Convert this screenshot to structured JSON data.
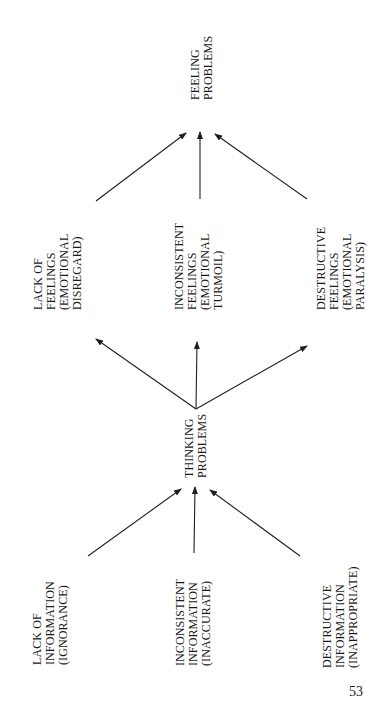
{
  "page_number": "53",
  "nodes": {
    "feeling_problems": {
      "lines": [
        "FEELING",
        "PROBLEMS"
      ]
    },
    "lack_of_feelings": {
      "lines": [
        "LACK OF",
        "FEELINGS",
        "(EMOTIONAL",
        "DISREGARD)"
      ]
    },
    "inconsistent_feelings": {
      "lines": [
        "INCONSISTENT",
        "FEELINGS",
        "(EMOTIONAL",
        "TURMOIL)"
      ]
    },
    "destructive_feelings": {
      "lines": [
        "DESTRUCTIVE",
        "FEELINGS",
        "(EMOTIONAL",
        "PARALYSIS)"
      ]
    },
    "thinking_problems": {
      "lines": [
        "THINKING",
        "PROBLEMS"
      ]
    },
    "lack_of_information": {
      "lines": [
        "LACK OF",
        "INFORMATION",
        "(IGNORANCE)"
      ]
    },
    "inconsistent_information": {
      "lines": [
        "INCONSISTENT",
        "INFORMATION",
        "(INACCURATE)"
      ]
    },
    "destructive_information": {
      "lines": [
        "DESTRUCTIVE",
        "INFORMATION",
        "(INAPPROPRIATE)"
      ]
    }
  },
  "edges": [
    {
      "from": "lack_of_information",
      "to": "thinking_problems"
    },
    {
      "from": "inconsistent_information",
      "to": "thinking_problems"
    },
    {
      "from": "destructive_information",
      "to": "thinking_problems"
    },
    {
      "from": "thinking_problems",
      "to": "lack_of_feelings"
    },
    {
      "from": "thinking_problems",
      "to": "inconsistent_feelings"
    },
    {
      "from": "thinking_problems",
      "to": "destructive_feelings"
    },
    {
      "from": "lack_of_feelings",
      "to": "feeling_problems"
    },
    {
      "from": "inconsistent_feelings",
      "to": "feeling_problems"
    },
    {
      "from": "destructive_feelings",
      "to": "feeling_problems"
    }
  ],
  "colors": {
    "ink": "#1a1a1a",
    "background": "#ffffff"
  }
}
